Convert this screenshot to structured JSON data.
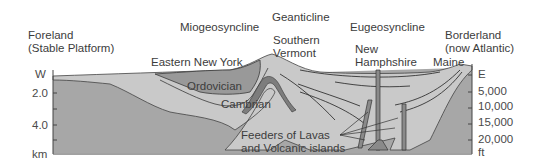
{
  "diagram": {
    "type": "geologic-cross-section",
    "regions": {
      "foreland": {
        "line1": "Foreland",
        "line2": "(Stable Platform)"
      },
      "miogeosyncline": "Miogeosyncline",
      "geanticline": "Geanticline",
      "eugeosyncline": "Eugeosyncline",
      "borderland": {
        "line1": "Borderland",
        "line2": "(now Atlantic)"
      }
    },
    "places": {
      "eastern_new_york": "Eastern New York",
      "southern_vermont": {
        "line1": "Southern",
        "line2": "Vermont"
      },
      "new_hampshire": {
        "line1": "New",
        "line2": "Hamphshire"
      },
      "maine": "Maine"
    },
    "units": {
      "ordovician": "Ordovician",
      "cambrian": "Cambrian",
      "feeders": {
        "line1": "Feeders of Lavas",
        "line2": "and Volcanic islands"
      }
    },
    "left_axis": {
      "direction": "W",
      "ticks": [
        "2.0",
        "4.0"
      ],
      "unit": "km"
    },
    "right_axis": {
      "direction": "E",
      "ticks": [
        "5,000",
        "10,000",
        "15,000",
        "20,000"
      ],
      "unit": "ft"
    },
    "colors": {
      "basement": "#a9a9a9",
      "light_sediment": "#c8c8c8",
      "dark_layer": "#8c8c8c",
      "outline": "#3a3a3a"
    }
  }
}
